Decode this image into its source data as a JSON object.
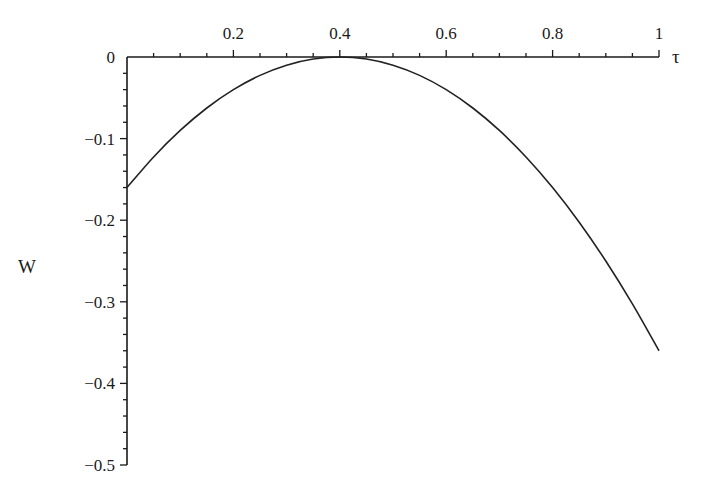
{
  "chart_data": {
    "type": "line",
    "title": "",
    "xlabel": "τ",
    "ylabel": "W",
    "xlim": [
      0,
      1
    ],
    "ylim": [
      -0.5,
      0
    ],
    "x_axis_position": "top",
    "x_ticks": [
      0.2,
      0.4,
      0.6,
      0.8,
      1
    ],
    "x_tick_labels": [
      "0.2",
      "0.4",
      "0.6",
      "0.8",
      "1"
    ],
    "x_minor_step": 0.05,
    "y_ticks": [
      0,
      -0.1,
      -0.2,
      -0.3,
      -0.4,
      -0.5
    ],
    "y_tick_labels": [
      "0",
      "−0.1",
      "−0.2",
      "−0.3",
      "−0.4",
      "−0.5"
    ],
    "y_minor_step": 0.02,
    "grid": false,
    "legend": "none",
    "series": [
      {
        "name": "W(τ)",
        "color": "#222222",
        "x": [
          0,
          0.05,
          0.1,
          0.15,
          0.2,
          0.25,
          0.3,
          0.35,
          0.4,
          0.45,
          0.5,
          0.55,
          0.6,
          0.65,
          0.7,
          0.75,
          0.8,
          0.85,
          0.9,
          0.95,
          1
        ],
        "y": [
          -0.16,
          -0.1225,
          -0.09,
          -0.0625,
          -0.04,
          -0.0225,
          -0.01,
          -0.0025,
          0,
          -0.0025,
          -0.01,
          -0.0225,
          -0.04,
          -0.0625,
          -0.09,
          -0.1225,
          -0.16,
          -0.2025,
          -0.25,
          -0.3025,
          -0.36
        ]
      }
    ]
  }
}
